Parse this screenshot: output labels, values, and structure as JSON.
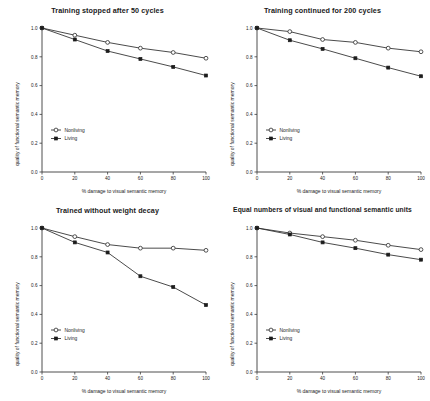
{
  "figure": {
    "background": "#ffffff",
    "ink": "#2b2b2b",
    "panel_count": 4
  },
  "chart_data": [
    {
      "type": "line",
      "title": "Training stopped after 50 cycles",
      "xlabel": "% damage to visual semantic memory",
      "ylabel": "quality of functional semantic memory",
      "x": [
        0,
        20,
        40,
        60,
        80,
        100
      ],
      "xticklabels": [
        "0",
        "20",
        "40",
        "60",
        "80",
        "100"
      ],
      "yticklabels": [
        "0.0",
        "0.2",
        "0.4",
        "0.6",
        "0.8",
        "1.0"
      ],
      "xlim": [
        0,
        100
      ],
      "ylim": [
        0.0,
        1.0
      ],
      "grid": false,
      "legend_position": "lower left",
      "series": [
        {
          "name": "Nonliving",
          "marker": "open-circle",
          "values": [
            1.0,
            0.95,
            0.9,
            0.86,
            0.83,
            0.79
          ]
        },
        {
          "name": "Living",
          "marker": "filled-square",
          "values": [
            1.0,
            0.92,
            0.84,
            0.785,
            0.73,
            0.67
          ]
        }
      ]
    },
    {
      "type": "line",
      "title": "Training continued for 200 cycles",
      "xlabel": "% damage to visual semantic memory",
      "ylabel": "quality of functional semantic memory",
      "x": [
        0,
        20,
        40,
        60,
        80,
        100
      ],
      "xticklabels": [
        "0",
        "20",
        "40",
        "60",
        "80",
        "100"
      ],
      "yticklabels": [
        "0.0",
        "0.2",
        "0.4",
        "0.6",
        "0.8",
        "1.0"
      ],
      "xlim": [
        0,
        100
      ],
      "ylim": [
        0.0,
        1.0
      ],
      "grid": false,
      "legend_position": "lower left",
      "series": [
        {
          "name": "Nonliving",
          "marker": "open-circle",
          "values": [
            1.0,
            0.975,
            0.92,
            0.9,
            0.86,
            0.835
          ]
        },
        {
          "name": "Living",
          "marker": "filled-square",
          "values": [
            1.0,
            0.915,
            0.855,
            0.79,
            0.725,
            0.665
          ]
        }
      ]
    },
    {
      "type": "line",
      "title": "Trained without weight decay",
      "xlabel": "% damage to visual semantic memory",
      "ylabel": "quality of functional semantic memory",
      "x": [
        0,
        20,
        40,
        60,
        80,
        100
      ],
      "xticklabels": [
        "0",
        "20",
        "40",
        "60",
        "80",
        "100"
      ],
      "yticklabels": [
        "0.0",
        "0.2",
        "0.4",
        "0.6",
        "0.8",
        "1.0"
      ],
      "xlim": [
        0,
        100
      ],
      "ylim": [
        0.0,
        1.0
      ],
      "grid": false,
      "legend_position": "lower left",
      "series": [
        {
          "name": "Nonliving",
          "marker": "open-circle",
          "values": [
            1.0,
            0.94,
            0.885,
            0.86,
            0.86,
            0.845
          ]
        },
        {
          "name": "Living",
          "marker": "filled-square",
          "values": [
            1.0,
            0.9,
            0.83,
            0.665,
            0.59,
            0.465
          ]
        }
      ]
    },
    {
      "type": "line",
      "title": "Equal numbers of visual and functional semantic units",
      "xlabel": "% damage to visual semantic memory",
      "ylabel": "quality of functional semantic memory",
      "x": [
        0,
        20,
        40,
        60,
        80,
        100
      ],
      "xticklabels": [
        "0",
        "20",
        "40",
        "60",
        "80",
        "100"
      ],
      "yticklabels": [
        "0.0",
        "0.2",
        "0.4",
        "0.6",
        "0.8",
        "1.0"
      ],
      "xlim": [
        0,
        100
      ],
      "ylim": [
        0.0,
        1.0
      ],
      "grid": false,
      "legend_position": "lower left",
      "series": [
        {
          "name": "Nonliving",
          "marker": "open-circle",
          "values": [
            1.0,
            0.965,
            0.94,
            0.915,
            0.88,
            0.85
          ]
        },
        {
          "name": "Living",
          "marker": "filled-square",
          "values": [
            1.0,
            0.955,
            0.9,
            0.86,
            0.815,
            0.78
          ]
        }
      ]
    }
  ]
}
